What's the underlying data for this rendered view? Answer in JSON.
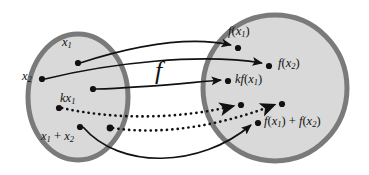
{
  "diagram": {
    "type": "linear-transformation-mapping",
    "map_label": "f",
    "domain_set": {
      "name": "domain-ellipse",
      "points": [
        {
          "id": "x1",
          "label_main": "x",
          "label_sub": "1",
          "cx": 78,
          "cy": 63
        },
        {
          "id": "x2",
          "label_main": "x",
          "label_sub": "2",
          "cx": 42,
          "cy": 79
        },
        {
          "id": "kx1",
          "label_main": "kx",
          "label_sub": "1",
          "cx": 93,
          "cy": 89
        },
        {
          "id": "unlabeled-upper",
          "label_main": "",
          "label_sub": "",
          "cx": 59,
          "cy": 108
        },
        {
          "id": "x1plusx2",
          "label_main": "x",
          "label_sub": "1",
          "label_op": " + ",
          "label_main2": "x",
          "label_sub2": "2",
          "cx": 80,
          "cy": 127
        },
        {
          "id": "unlabeled-lower",
          "label_main": "",
          "label_sub": "",
          "cx": 110,
          "cy": 128
        }
      ]
    },
    "codomain_set": {
      "name": "codomain-ellipse",
      "points": [
        {
          "id": "fx1",
          "cx": 238,
          "cy": 48
        },
        {
          "id": "fx2",
          "cx": 269,
          "cy": 66
        },
        {
          "id": "kfx1",
          "cx": 228,
          "cy": 81
        },
        {
          "id": "unlabeled-upper-image",
          "cx": 241,
          "cy": 105
        },
        {
          "id": "unlabeled-lower-image",
          "cx": 282,
          "cy": 104
        },
        {
          "id": "fx1plusfx2",
          "cx": 258,
          "cy": 123
        }
      ]
    },
    "labels": {
      "x1": {
        "main": "x",
        "sub": "1"
      },
      "x2": {
        "main": "x",
        "sub": "2"
      },
      "kx1": {
        "prefix": "k",
        "main": "x",
        "sub": "1"
      },
      "x1_plus_x2": {
        "main1": "x",
        "sub1": "1",
        "op": " + ",
        "main2": "x",
        "sub2": "2"
      },
      "fx1": {
        "fn": "f",
        "open": "(",
        "main": "x",
        "sub": "1",
        "close": ")"
      },
      "fx2": {
        "fn": "f",
        "open": "(",
        "main": "x",
        "sub": "2",
        "close": ")"
      },
      "kfx1": {
        "prefix": "k",
        "fn": "f",
        "open": "(",
        "main": "x",
        "sub": "1",
        "close": ")"
      },
      "fx1_plus_fx2": {
        "fn1": "f",
        "open1": "(",
        "main1": "x",
        "sub1": "1",
        "close1": ")",
        "op": " + ",
        "fn2": "f",
        "open2": "(",
        "main2": "x",
        "sub2": "2",
        "close2": ")"
      }
    },
    "arrows": [
      {
        "id": "arrow-x1-to-fx1",
        "style": "solid",
        "from": "x1",
        "to": "fx1"
      },
      {
        "id": "arrow-x2-to-fx2",
        "style": "solid",
        "from": "x2",
        "to": "fx2"
      },
      {
        "id": "arrow-kx1-to-kfx1",
        "style": "solid",
        "from": "kx1",
        "to": "kfx1"
      },
      {
        "id": "arrow-unlabeled-upper",
        "style": "dotted",
        "from": "unlabeled-upper",
        "to": "unlabeled-upper-image"
      },
      {
        "id": "arrow-unlabeled-lower",
        "style": "dotted",
        "from": "unlabeled-lower",
        "to": "unlabeled-lower-image"
      },
      {
        "id": "arrow-sum-to-sum",
        "style": "solid",
        "from": "x1plusx2",
        "to": "fx1plusfx2"
      }
    ],
    "colors": {
      "set_fill": "#d9d9d9",
      "set_stroke": "#7a7a7a",
      "ink": "#111111",
      "background": "#ffffff"
    }
  }
}
